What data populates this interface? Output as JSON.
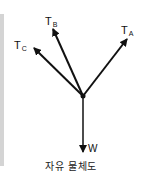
{
  "diagram": {
    "title": "자유 물체도",
    "junction": {
      "x": 83,
      "y": 96
    },
    "forces": [
      {
        "id": "TA",
        "symbol": "T",
        "subscript": "A",
        "tip": {
          "x": 127,
          "y": 39
        }
      },
      {
        "id": "TB",
        "symbol": "T",
        "subscript": "B",
        "tip": {
          "x": 53,
          "y": 29
        }
      },
      {
        "id": "TC",
        "symbol": "T",
        "subscript": "C",
        "tip": {
          "x": 34,
          "y": 48
        }
      },
      {
        "id": "W",
        "symbol": "W",
        "subscript": "",
        "tip": {
          "x": 83,
          "y": 152
        }
      }
    ],
    "colors": {
      "line": "#111111",
      "side_bar": "#d4d4d4"
    }
  }
}
